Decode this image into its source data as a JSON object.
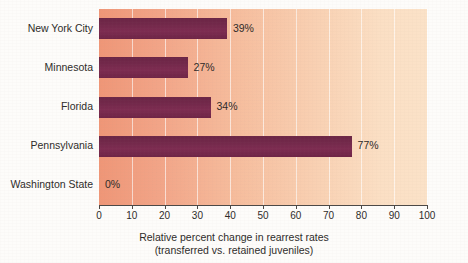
{
  "chart_data": {
    "type": "bar",
    "orientation": "horizontal",
    "title": "",
    "subtitle": "",
    "xlabel": "Relative percent change in rearrest rates (transferred vs. retained juveniles)",
    "ylabel": "",
    "xlim": [
      0,
      100
    ],
    "grid": true,
    "legend": null,
    "categories": [
      "New York City",
      "Minnesota",
      "Florida",
      "Pennsylvania",
      "Washington State"
    ],
    "values": [
      39,
      27,
      34,
      77,
      0
    ],
    "value_labels": [
      "39%",
      "27%",
      "34%",
      "77%",
      "0%"
    ],
    "xticks": [
      0,
      10,
      20,
      30,
      40,
      50,
      60,
      70,
      80,
      90,
      100
    ],
    "xtick_labels": [
      "0",
      "10",
      "20",
      "30",
      "40",
      "50",
      "60",
      "70",
      "80",
      "90",
      "100"
    ],
    "bar_color": "#72284a",
    "plot_bg_start": "#ef9677",
    "plot_bg_end": "#fbe2c8",
    "gridline_color": "#ffffff",
    "axis_color": "#4a4745",
    "text_color": "#2d2b29"
  },
  "caption": {
    "line1": "Relative percent change in rearrest rates",
    "line2": "(transferred vs. retained juveniles)"
  }
}
